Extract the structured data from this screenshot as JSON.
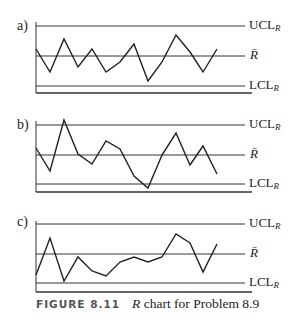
{
  "caption": {
    "figure_number": "FIGURE 8.11",
    "symbol": "R",
    "text": " chart for Problem 8.9"
  },
  "labels": {
    "ucl": "UCL",
    "center": "R̄",
    "lcl": "LCL",
    "subscript": "R"
  },
  "chart_data": [
    {
      "type": "line",
      "panel": "a)",
      "title": "",
      "x": [
        1,
        2,
        3,
        4,
        5,
        6,
        7,
        8,
        9,
        10,
        11,
        12,
        13,
        14
      ],
      "ucl_y": 26,
      "center_y": 56,
      "lcl_y": 86,
      "bottom_y": 93,
      "top_y": 22,
      "pixel_y": [
        49,
        72,
        39,
        67,
        49,
        72,
        62,
        44,
        81,
        62,
        35,
        52,
        72,
        49
      ],
      "relative_values": [
        0.23,
        -0.53,
        0.57,
        -0.37,
        0.23,
        -0.53,
        -0.2,
        0.4,
        -0.83,
        -0.2,
        0.7,
        0.13,
        -0.53,
        0.23
      ],
      "reference_lines": [
        "UCL_R",
        "R̄",
        "LCL_R"
      ],
      "note": "values relative to R̄ (1=UCL, -1=LCL); no numeric axis shown"
    },
    {
      "type": "line",
      "panel": "b)",
      "title": "",
      "x": [
        1,
        2,
        3,
        4,
        5,
        6,
        7,
        8,
        9,
        10,
        11,
        12,
        13,
        14
      ],
      "ucl_y": 125,
      "center_y": 155,
      "lcl_y": 184,
      "bottom_y": 192,
      "top_y": 121,
      "pixel_y": [
        148,
        171,
        120,
        154,
        164,
        141,
        149,
        176,
        188,
        155,
        133,
        165,
        146,
        174
      ],
      "relative_values": [
        0.23,
        -0.55,
        1.17,
        0.03,
        -0.31,
        0.47,
        0.2,
        -0.72,
        -1.14,
        0.0,
        0.73,
        -0.34,
        0.3,
        -0.66
      ],
      "reference_lines": [
        "UCL_R",
        "R̄",
        "LCL_R"
      ],
      "note": "point 3 above UCL; point 9 below LCL"
    },
    {
      "type": "line",
      "panel": "c)",
      "title": "",
      "x": [
        1,
        2,
        3,
        4,
        5,
        6,
        7,
        8,
        9,
        10,
        11,
        12,
        13,
        14
      ],
      "ucl_y": 224,
      "center_y": 254,
      "lcl_y": 283,
      "bottom_y": 292,
      "top_y": 221,
      "pixel_y": [
        275,
        238,
        281,
        257,
        271,
        276,
        262,
        257,
        262,
        257,
        234,
        243,
        272,
        244
      ],
      "relative_values": [
        -0.72,
        0.55,
        -0.93,
        -0.1,
        -0.59,
        -0.76,
        -0.28,
        -0.1,
        -0.28,
        -0.1,
        0.69,
        0.38,
        -0.62,
        0.34
      ],
      "reference_lines": [
        "UCL_R",
        "R̄",
        "LCL_R"
      ]
    }
  ]
}
